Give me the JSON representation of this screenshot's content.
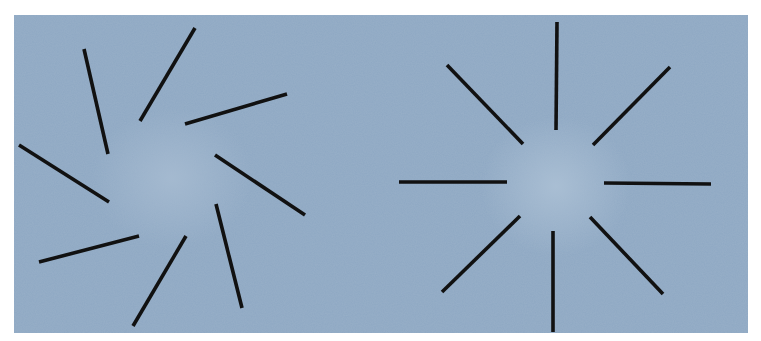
{
  "figure": {
    "background": "#ffffff",
    "panel": {
      "x": 14,
      "y": 15,
      "width": 734,
      "height": 318,
      "color": "#8ea8c3",
      "center_glow": "#a3b8cf"
    },
    "line_color": "#111111",
    "line_width": 3.6
  },
  "diagrams": [
    {
      "name": "rotated-pinwheel",
      "description": "Eight radial line segments, each rotated off-axis (illusory spiral)",
      "lines": [
        {
          "x1": 84,
          "y1": 49,
          "x2": 108,
          "y2": 154
        },
        {
          "x1": 195,
          "y1": 28,
          "x2": 140,
          "y2": 121
        },
        {
          "x1": 287,
          "y1": 94,
          "x2": 185,
          "y2": 124
        },
        {
          "x1": 19,
          "y1": 145,
          "x2": 109,
          "y2": 202
        },
        {
          "x1": 215,
          "y1": 155,
          "x2": 305,
          "y2": 215
        },
        {
          "x1": 39,
          "y1": 262,
          "x2": 139,
          "y2": 236
        },
        {
          "x1": 186,
          "y1": 236,
          "x2": 133,
          "y2": 326
        },
        {
          "x1": 216,
          "y1": 204,
          "x2": 242,
          "y2": 308
        }
      ]
    },
    {
      "name": "radial-starburst",
      "description": "Eight line segments radiating from a common empty center",
      "lines": [
        {
          "x1": 557,
          "y1": 22,
          "x2": 556,
          "y2": 130
        },
        {
          "x1": 447,
          "y1": 65,
          "x2": 523,
          "y2": 144
        },
        {
          "x1": 670,
          "y1": 67,
          "x2": 593,
          "y2": 145
        },
        {
          "x1": 399,
          "y1": 182,
          "x2": 507,
          "y2": 182
        },
        {
          "x1": 604,
          "y1": 183,
          "x2": 711,
          "y2": 184
        },
        {
          "x1": 520,
          "y1": 216,
          "x2": 442,
          "y2": 292
        },
        {
          "x1": 553,
          "y1": 231,
          "x2": 553,
          "y2": 332
        },
        {
          "x1": 590,
          "y1": 217,
          "x2": 663,
          "y2": 294
        }
      ]
    }
  ]
}
